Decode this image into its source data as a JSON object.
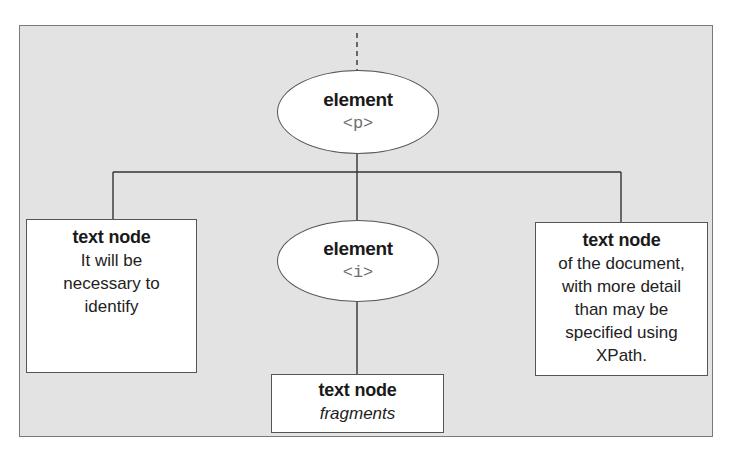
{
  "diagram": {
    "type": "dom-tree",
    "background_color": "#e3e3e3",
    "nodes": {
      "element_p": {
        "kind": "element",
        "title": "element",
        "tag": "<p>"
      },
      "element_i": {
        "kind": "element",
        "title": "element",
        "tag": "<i>"
      },
      "text_left": {
        "kind": "text node",
        "title": "text node",
        "body": "It will be\nnecessary to\nidentify"
      },
      "text_right": {
        "kind": "text node",
        "title": "text node",
        "body": "of the document,\nwith more detail\nthan may be\nspecified using\nXPath."
      },
      "text_bottom": {
        "kind": "text node",
        "title": "text node",
        "body": "fragments",
        "body_style": "italic"
      }
    },
    "edges": [
      {
        "from": "parent (dashed)",
        "to": "element_p",
        "style": "dashed"
      },
      {
        "from": "element_p",
        "to": "text_left",
        "style": "solid"
      },
      {
        "from": "element_p",
        "to": "element_i",
        "style": "solid"
      },
      {
        "from": "element_p",
        "to": "text_right",
        "style": "solid"
      },
      {
        "from": "element_i",
        "to": "text_bottom",
        "style": "solid"
      }
    ]
  }
}
